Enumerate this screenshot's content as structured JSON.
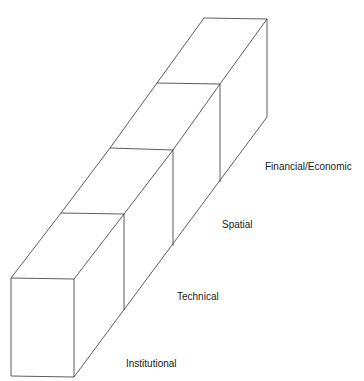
{
  "diagram": {
    "type": "stacked-blocks-isometric",
    "colors": {
      "stroke": "#333333",
      "fill": "#ffffff",
      "text": "#1a1a1a"
    },
    "layers": [
      {
        "label": "Institutional"
      },
      {
        "label": "Technical"
      },
      {
        "label": "Spatial"
      },
      {
        "label": "Financial/Economic"
      }
    ]
  }
}
